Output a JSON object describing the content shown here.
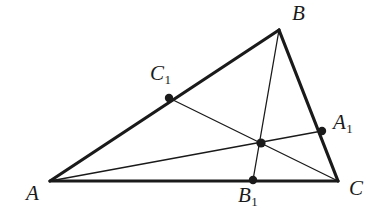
{
  "figure": {
    "kind": "geometry-diagram",
    "width": 389,
    "height": 223,
    "background_color": "#ffffff",
    "stroke_color": "#1a1a1a",
    "thick_stroke_width": 3.2,
    "thin_stroke_width": 1.3,
    "point_radius": 4.2
  },
  "points": {
    "A": {
      "label": "A",
      "sub": "",
      "x": 50,
      "y": 181,
      "label_x": 26,
      "label_y": 183,
      "marked": false
    },
    "B": {
      "label": "B",
      "sub": "",
      "x": 279,
      "y": 30,
      "label_x": 292,
      "label_y": 3,
      "marked": false
    },
    "C": {
      "label": "C",
      "sub": "",
      "x": 338,
      "y": 181,
      "label_x": 349,
      "label_y": 178,
      "marked": false
    },
    "A1": {
      "label": "A",
      "sub": "1",
      "x": 322,
      "y": 131,
      "label_x": 333,
      "label_y": 112,
      "marked": true
    },
    "B1": {
      "label": "B",
      "sub": "1",
      "x": 253,
      "y": 180,
      "label_x": 238,
      "label_y": 185,
      "marked": true
    },
    "C1": {
      "label": "C",
      "sub": "1",
      "x": 169,
      "y": 98,
      "label_x": 150,
      "label_y": 63,
      "marked": true
    },
    "G": {
      "label": "",
      "sub": "",
      "x": 261,
      "y": 143,
      "label_x": 0,
      "label_y": 0,
      "marked": true
    }
  },
  "sides": [
    {
      "name": "side-AB",
      "from": "A",
      "to": "B",
      "weight": "thick"
    },
    {
      "name": "side-BC",
      "from": "B",
      "to": "C",
      "weight": "thick"
    },
    {
      "name": "side-AC",
      "from": "A",
      "to": "C",
      "weight": "thick"
    }
  ],
  "cevians": [
    {
      "name": "cevian-A-A1",
      "from": "A",
      "to": "A1",
      "weight": "thin"
    },
    {
      "name": "cevian-B-B1",
      "from": "B",
      "to": "B1",
      "weight": "thin"
    },
    {
      "name": "cevian-C-C1",
      "from": "C",
      "to": "C1",
      "weight": "thin"
    }
  ],
  "labels": {
    "A": "A",
    "B": "B",
    "C": "C",
    "A1": "A",
    "B1": "B",
    "C1": "C",
    "sub1": "1"
  }
}
